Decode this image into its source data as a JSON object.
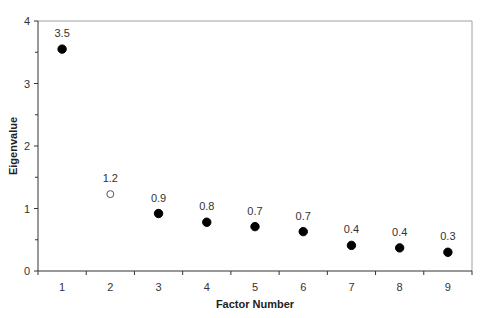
{
  "chart_data": {
    "type": "scatter",
    "title": "",
    "xlabel": "Factor Number",
    "ylabel": "Eigenvalue",
    "categories": [
      "1",
      "2",
      "3",
      "4",
      "5",
      "6",
      "7",
      "8",
      "9"
    ],
    "x": [
      1,
      2,
      3,
      4,
      5,
      6,
      7,
      8,
      9
    ],
    "values": [
      3.55,
      1.23,
      0.92,
      0.78,
      0.71,
      0.63,
      0.41,
      0.37,
      0.3
    ],
    "data_labels": [
      "3.5",
      "1.2",
      "0.9",
      "0.8",
      "0.7",
      "0.7",
      "0.4",
      "0.4",
      "0.3"
    ],
    "marker_styles": [
      "filled",
      "open",
      "filled",
      "filled",
      "filled",
      "filled",
      "filled",
      "filled",
      "filled"
    ],
    "ylim": [
      0,
      4
    ],
    "yticks": [
      "0",
      "1",
      "2",
      "3",
      "4"
    ],
    "grid": false,
    "legend": null
  },
  "colors": {
    "marker": "#000000",
    "axis": "#333333",
    "frame": "#a0a0a0"
  }
}
